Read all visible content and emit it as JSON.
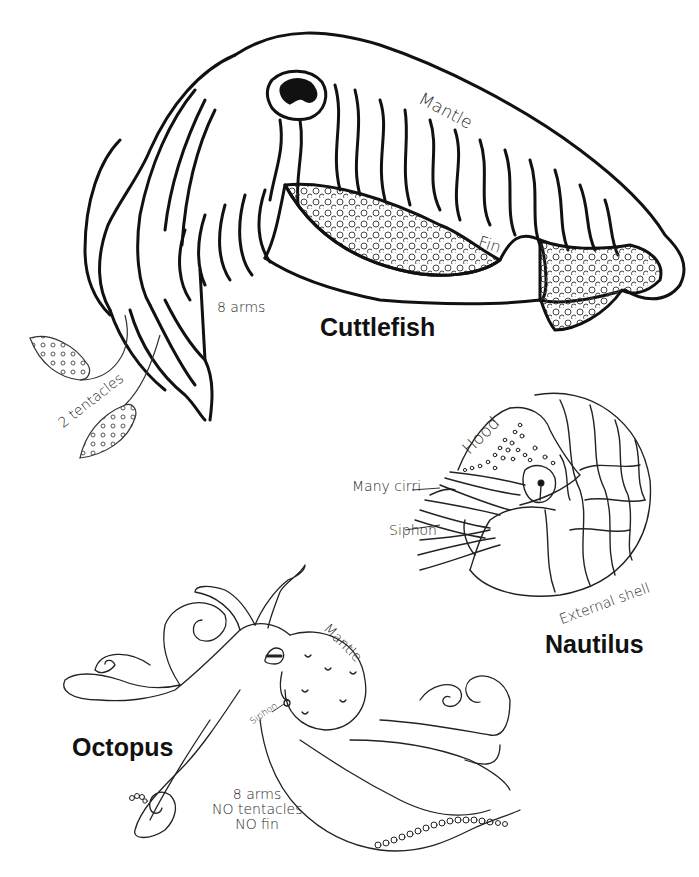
{
  "diagram": {
    "animals": [
      {
        "name": "Cuttlefish",
        "labels": {
          "mantle": "Mantle",
          "fin": "Fin",
          "arms": "8 arms",
          "tentacles": "2 tentacles"
        }
      },
      {
        "name": "Nautilus",
        "labels": {
          "hood": "Hood",
          "cirri": "Many cirri",
          "siphon": "Siphon",
          "shell": "External shell"
        }
      },
      {
        "name": "Octopus",
        "labels": {
          "mantle": "Mantle",
          "siphon": "Siphon",
          "note_line1": "8 arms",
          "note_line2": "NO tentacles",
          "note_line3": "NO fin"
        }
      }
    ],
    "colors": {
      "line": "#111111",
      "label_text": "#2a2a2a",
      "background": "#ffffff"
    }
  }
}
